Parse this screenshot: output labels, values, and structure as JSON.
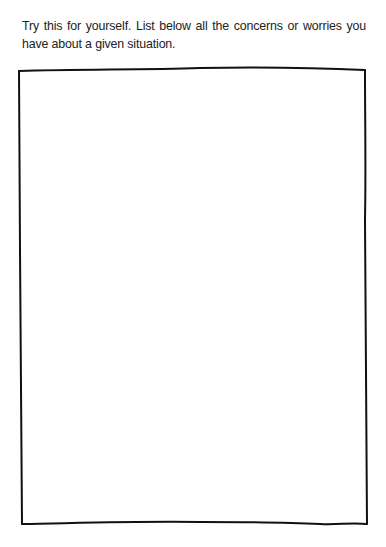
{
  "worksheet": {
    "instructions": "Try this for yourself. List below all the concerns or worries you have about a given situation.",
    "response_box": {
      "content": "",
      "border_color": "#111111",
      "style": "hand-drawn"
    }
  }
}
